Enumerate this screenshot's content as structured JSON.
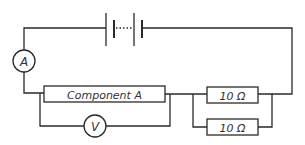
{
  "diagram": {
    "type": "circuit",
    "battery": {
      "label": "",
      "cells": 2
    },
    "ammeter": {
      "label": "A"
    },
    "voltmeter": {
      "label": "V"
    },
    "component": {
      "label": "Component A"
    },
    "resistors": [
      {
        "label": "10 Ω"
      },
      {
        "label": "10 Ω"
      }
    ],
    "colors": {
      "wire": "#2a2a2a",
      "text": "#333333",
      "background": "#ffffff"
    }
  }
}
